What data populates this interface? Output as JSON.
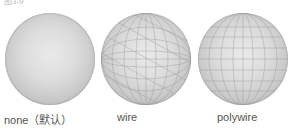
{
  "header": {
    "partial_text": "图3-9"
  },
  "spheres": [
    {
      "mode": "none",
      "label": "none（默认）"
    },
    {
      "mode": "wire",
      "label": "wire"
    },
    {
      "mode": "polywire",
      "label": "polywire"
    }
  ]
}
